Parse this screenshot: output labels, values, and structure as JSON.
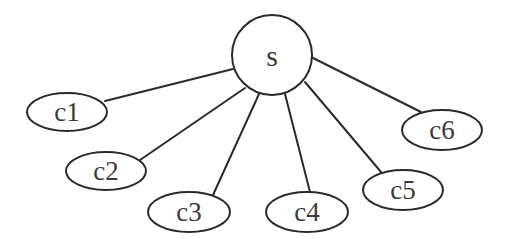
{
  "diagram": {
    "type": "star-tree",
    "colors": {
      "stroke": "#2a2a2a",
      "text": "#3a3a3a",
      "background": "#ffffff"
    },
    "root": {
      "id": "s",
      "label": "s",
      "shape": "circle",
      "cx": 272,
      "cy": 55,
      "r": 40
    },
    "children": [
      {
        "id": "c1",
        "label": "c1",
        "shape": "ellipse",
        "cx": 67,
        "cy": 112,
        "rx": 40,
        "ry": 19
      },
      {
        "id": "c2",
        "label": "c2",
        "shape": "ellipse",
        "cx": 106,
        "cy": 171,
        "rx": 40,
        "ry": 19
      },
      {
        "id": "c3",
        "label": "c3",
        "shape": "ellipse",
        "cx": 189,
        "cy": 212,
        "rx": 41,
        "ry": 20
      },
      {
        "id": "c4",
        "label": "c4",
        "shape": "ellipse",
        "cx": 307,
        "cy": 212,
        "rx": 41,
        "ry": 20
      },
      {
        "id": "c5",
        "label": "c5",
        "shape": "ellipse",
        "cx": 403,
        "cy": 190,
        "rx": 40,
        "ry": 20
      },
      {
        "id": "c6",
        "label": "c6",
        "shape": "ellipse",
        "cx": 442,
        "cy": 130,
        "rx": 40,
        "ry": 20
      }
    ],
    "edges": [
      {
        "from": "s",
        "to": "c1",
        "x1": 233,
        "y1": 69,
        "x2": 105,
        "y2": 101
      },
      {
        "from": "s",
        "to": "c2",
        "x1": 245,
        "y1": 88,
        "x2": 140,
        "y2": 160
      },
      {
        "from": "s",
        "to": "c3",
        "x1": 259,
        "y1": 94,
        "x2": 213,
        "y2": 195
      },
      {
        "from": "s",
        "to": "c4",
        "x1": 285,
        "y1": 94,
        "x2": 310,
        "y2": 192
      },
      {
        "from": "s",
        "to": "c5",
        "x1": 305,
        "y1": 82,
        "x2": 381,
        "y2": 172
      },
      {
        "from": "s",
        "to": "c6",
        "x1": 311,
        "y1": 57,
        "x2": 421,
        "y2": 112
      }
    ]
  }
}
